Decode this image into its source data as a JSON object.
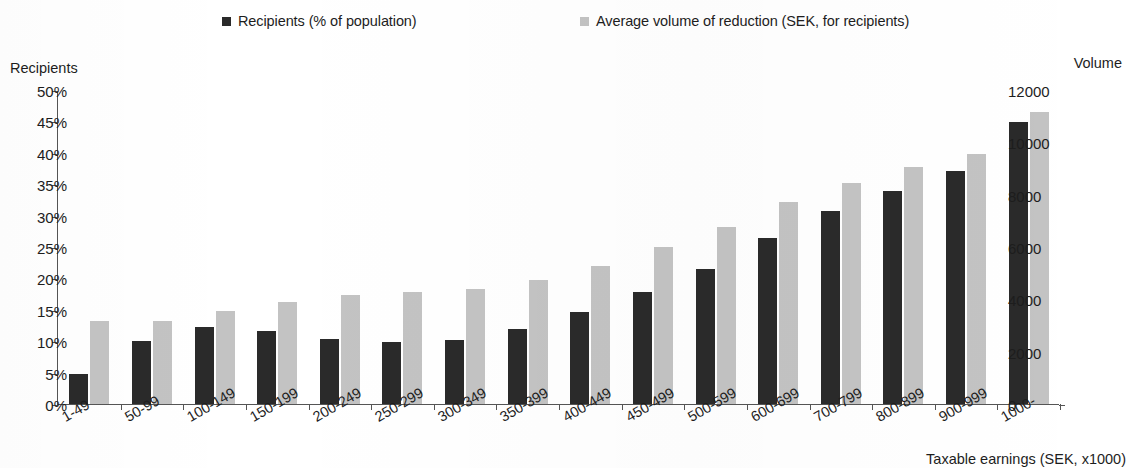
{
  "legend": {
    "entries": [
      {
        "label": "Recipients (% of population)",
        "color": "#2a2a2a",
        "icon": "square-marker-icon"
      },
      {
        "label": "Average volume of reduction (SEK, for recipients)",
        "color": "#c3c3c3",
        "icon": "square-marker-icon"
      }
    ]
  },
  "axes": {
    "y_left_title": "Recipients",
    "y_right_title": "Volume",
    "x_title": "Taxable earnings (SEK, x1000)",
    "y_left_ticks": [
      "0%",
      "5%",
      "10%",
      "15%",
      "20%",
      "25%",
      "30%",
      "35%",
      "40%",
      "45%",
      "50%"
    ],
    "y_right_ticks": [
      "0",
      "2000",
      "4000",
      "6000",
      "8000",
      "10000",
      "12000"
    ]
  },
  "chart_data": {
    "type": "bar",
    "title": "",
    "subtitle": "",
    "xlabel": "Taxable earnings (SEK, x1000)",
    "ylabel": "Recipients",
    "y2label": "Volume",
    "ylim": [
      0,
      50
    ],
    "y2lim": [
      0,
      12000
    ],
    "ytick_step": 5,
    "y2tick_step": 2000,
    "grid": false,
    "legend_position": "top",
    "categories": [
      "1-49",
      "50-99",
      "100-149",
      "150-199",
      "200-249",
      "250-299",
      "300-349",
      "350-399",
      "400-449",
      "450-499",
      "500-599",
      "600-699",
      "700-799",
      "800-899",
      "900-999",
      "1000-"
    ],
    "series": [
      {
        "name": "Recipients (% of population)",
        "axis": "left",
        "unit": "%",
        "color": "#2a2a2a",
        "values": [
          4.7,
          10.0,
          12.2,
          11.6,
          10.3,
          9.8,
          10.2,
          11.9,
          14.6,
          17.9,
          21.5,
          26.5,
          30.8,
          33.9,
          37.1,
          44.9
        ]
      },
      {
        "name": "Average volume of reduction (SEK, for recipients)",
        "axis": "right",
        "unit": "SEK",
        "color": "#c3c3c3",
        "values": [
          3180,
          3190,
          3540,
          3880,
          4150,
          4290,
          4380,
          4730,
          5280,
          6010,
          6750,
          7720,
          8450,
          9060,
          9560,
          11150
        ]
      }
    ]
  }
}
